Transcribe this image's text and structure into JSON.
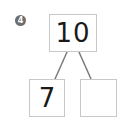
{
  "problem": {
    "number": "4",
    "whole": "10",
    "parts": [
      "7",
      ""
    ]
  },
  "colors": {
    "badge": "#6e6e6e",
    "box_border": "#c8c8c8",
    "line": "#7a7a7a",
    "text": "#1a1a1a"
  }
}
